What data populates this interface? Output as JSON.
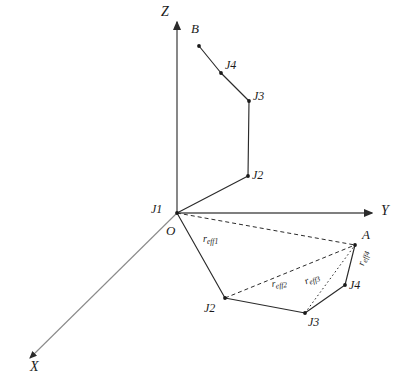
{
  "figure": {
    "background_color": "#ffffff",
    "line_color": "#2b2b2b",
    "text_color": "#1a1a1a"
  },
  "axes": [
    {
      "id": "z",
      "label": "Z",
      "direction": "up",
      "label_x": 161,
      "label_y": 5
    },
    {
      "id": "y",
      "label": "Y",
      "direction": "right",
      "label_x": 381,
      "label_y": 206
    },
    {
      "id": "x",
      "label": "X",
      "direction": "down-left",
      "label_x": 30,
      "label_y": 362
    }
  ],
  "origin": {
    "label": "O",
    "label_x": 166,
    "label_y": 227
  },
  "arm_chain": {
    "name": "manipulator-arm",
    "style": "solid",
    "nodes": [
      {
        "id": "j1",
        "label": "J1",
        "x": 177,
        "y": 213,
        "label_x": 151,
        "label_y": 203
      },
      {
        "id": "j2",
        "label": "J2",
        "x": 248,
        "y": 176,
        "label_x": 252,
        "label_y": 170
      },
      {
        "id": "j3",
        "label": "J3",
        "x": 249,
        "y": 101,
        "label_x": 253,
        "label_y": 91
      },
      {
        "id": "j4",
        "label": "J4",
        "x": 221,
        "y": 73,
        "label_x": 225,
        "label_y": 60
      },
      {
        "id": "b",
        "label": "B",
        "x": 199,
        "y": 46,
        "label_x": 191,
        "label_y": 23
      }
    ]
  },
  "projection_chain": {
    "name": "ground-projection",
    "style": "solid",
    "nodes": [
      {
        "id": "o",
        "label": "O",
        "x": 177,
        "y": 213,
        "label_x": 166,
        "label_y": 227
      },
      {
        "id": "j2_proj",
        "label": "J2",
        "x": 225,
        "y": 298,
        "label_x": 205,
        "label_y": 303
      },
      {
        "id": "j3_proj",
        "label": "J3",
        "x": 305,
        "y": 313,
        "label_x": 308,
        "label_y": 317
      },
      {
        "id": "j4_proj",
        "label": "J4",
        "x": 345,
        "y": 285,
        "label_x": 349,
        "label_y": 281
      },
      {
        "id": "a",
        "label": "A",
        "x": 355,
        "y": 245,
        "label_x": 362,
        "label_y": 229
      }
    ]
  },
  "effective_radii": [
    {
      "id": "reff1",
      "label": "r",
      "sub": "eff1",
      "from": "o",
      "to": "a",
      "style": "dashed",
      "label_x": 203,
      "label_y": 236,
      "rotation_class": ""
    },
    {
      "id": "reff2",
      "label": "r",
      "sub": "eff2",
      "from": "j2_proj",
      "to": "a",
      "style": "dashed",
      "label_x": 271,
      "label_y": 281,
      "rotation_class": "rot-reff2"
    },
    {
      "id": "reff3",
      "label": "r",
      "sub": "eff3",
      "from": "j3_proj",
      "to": "a",
      "style": "dotted",
      "label_x": 303,
      "label_y": 278,
      "rotation_class": "rot-reff3"
    },
    {
      "id": "reff4",
      "label": "r",
      "sub": "eff4",
      "from": "j4_proj",
      "to": "a",
      "style": "solid",
      "label_x": 355,
      "label_y": 264,
      "rotation_class": "rot-reff4"
    }
  ]
}
